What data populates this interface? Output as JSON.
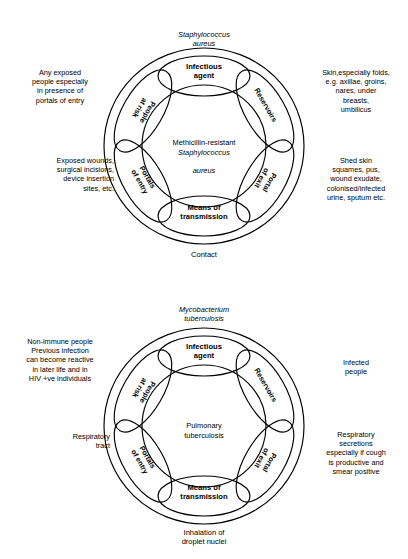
{
  "figures": [
    {
      "id": "mrsa",
      "organism": "Staphylococcus\naureus",
      "centre_plain": "Methicillin-resistant",
      "centre_italic_1": "Staphylococcus",
      "centre_italic_2": "aureus",
      "route": "Contact",
      "nodes": {
        "infectious_agent": "Infectious\nagent",
        "means_of_transmission": "Means of\ntransmission"
      },
      "links": {
        "reservoirs": "Reservoirs",
        "portal_of_exit": "Portal\nof exit",
        "portals_of_entry": "Portals\nof entry",
        "people_at_risk": "People\nat risk"
      },
      "annotations": {
        "reservoirs": "Skin,especially folds,\ne.g. axillae, groins,\nnares, under\nbreasts,\numbilicus",
        "portal_of_exit": "Shed skin\nsquames, pus,\nwound exudate,\ncolonised/infected\nurine, sputum etc.",
        "portals_of_entry": "Exposed wounds,\nsurgical incisions,\ndevice insertion\nsites, etc.",
        "people_at_risk": "Any exposed\npeople especially\nin presence of\nportals of entry"
      }
    },
    {
      "id": "tb",
      "organism": "Mycobacterium\ntuberculosis",
      "centre_plain": "Pulmonary\ntuberculosis",
      "centre_italic_1": "",
      "centre_italic_2": "",
      "route": "Inhalation of\ndroplet nuclei",
      "nodes": {
        "infectious_agent": "Infectious\nagent",
        "means_of_transmission": "Means of\ntransmission"
      },
      "links": {
        "reservoirs": "Reservoirs",
        "portal_of_exit": "Portal\nof exit",
        "portals_of_entry": "Portals\nof entry",
        "people_at_risk": "People\nat risk"
      },
      "annotations": {
        "reservoirs": "Infected\npeople",
        "portal_of_exit": "Respiratory\nsecretions\nespecially if cough\nis productive and\nsmear positive",
        "portals_of_entry": "Respiratory\ntract",
        "people_at_risk": "Non-immune people\nPrevious infection\ncan become reactive\nin later life and in\nHIV +ve individuals"
      }
    }
  ],
  "style": {
    "stroke_color": "#000000",
    "background": "#ffffff",
    "text_color": "#000000"
  }
}
